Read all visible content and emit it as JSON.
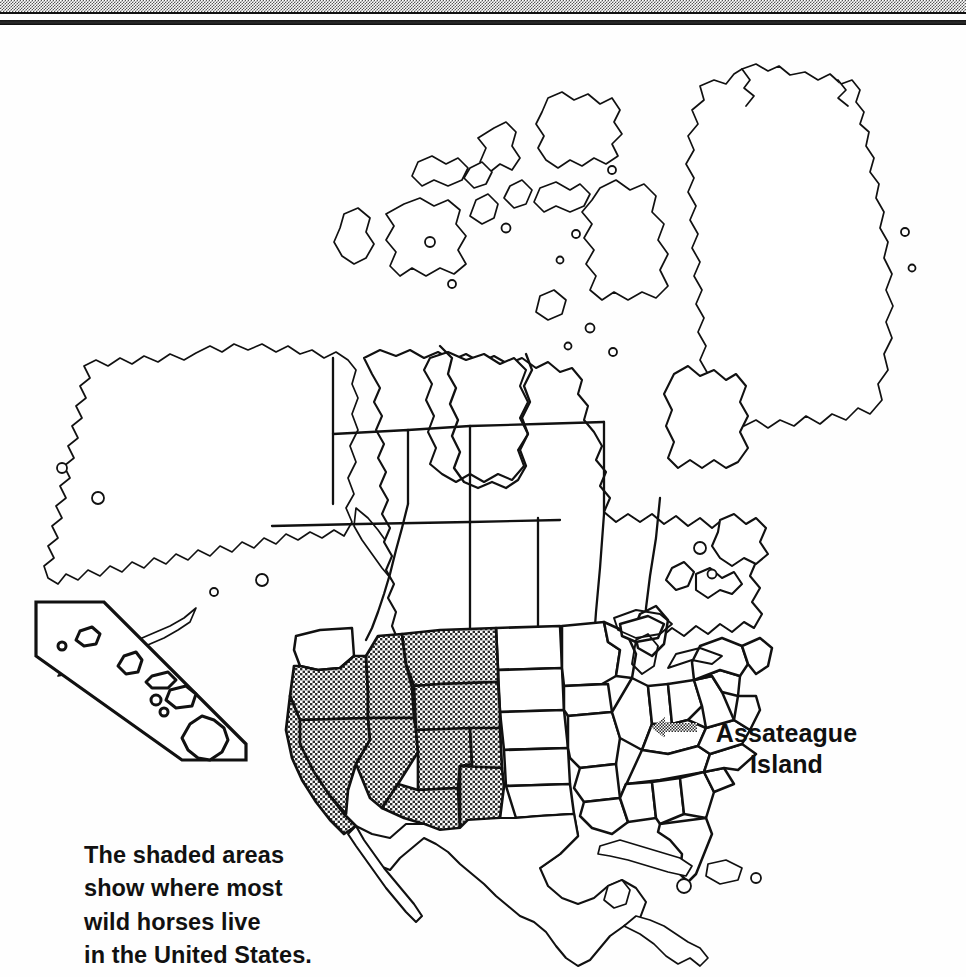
{
  "document": {
    "type": "scanned-map-figure",
    "subject": "North America map showing wild horse range",
    "background_color": "#ffffff",
    "ink_color": "#111111"
  },
  "header": {
    "halftone_band": "scan-artifact-halftone-band",
    "black_rule": "scan-artifact-black-rule"
  },
  "map": {
    "title_implied": "North America",
    "shaded_pattern": "crosshatch-stipple",
    "shaded_states": [
      "Oregon",
      "California",
      "Nevada",
      "Idaho",
      "Montana",
      "Wyoming",
      "Utah",
      "Colorado",
      "Arizona",
      "New Mexico"
    ],
    "unshaded_neighbors": [
      "Washington",
      "North Dakota",
      "South Dakota",
      "Nebraska",
      "Kansas",
      "Oklahoma",
      "Texas"
    ],
    "landmasses": [
      "Alaska",
      "Canada",
      "Greenland",
      "United States",
      "Mexico",
      "Central America",
      "Cuba",
      "Hispaniola",
      "Hawaii"
    ]
  },
  "labels": {
    "assateague": {
      "line1": "Assateague",
      "line2": "Island"
    },
    "caption": "The shaded areas\nshow where most\nwild horses live\nin the United States."
  },
  "inset": {
    "name": "Hawaii",
    "shape": "diagonal-parallelogram-box",
    "island_count": 8
  },
  "icons": {
    "pointer": "stippled-left-arrow-icon"
  },
  "colors": {
    "ink": "#111111",
    "paper": "#ffffff",
    "stipple": "#9a9a9a"
  }
}
